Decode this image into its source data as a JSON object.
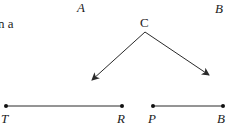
{
  "diagram": {
    "partial_text": "n a",
    "labels": {
      "A": "A",
      "B_top": "B",
      "C": "C",
      "T": "T",
      "R": "R",
      "P": "P",
      "B_bottom": "B"
    },
    "colors": {
      "line": "#2a2a2a",
      "text": "#222222",
      "background": "#ffffff"
    },
    "geometry": {
      "C_vertex": [
        145,
        32
      ],
      "left_arrow_end": [
        92,
        80
      ],
      "right_arrow_end": [
        209,
        75
      ],
      "segment_TR": {
        "from": [
          6,
          106
        ],
        "to": [
          122,
          106
        ]
      },
      "segment_PB": {
        "from": [
          153,
          106
        ],
        "to": [
          223,
          106
        ]
      }
    }
  }
}
